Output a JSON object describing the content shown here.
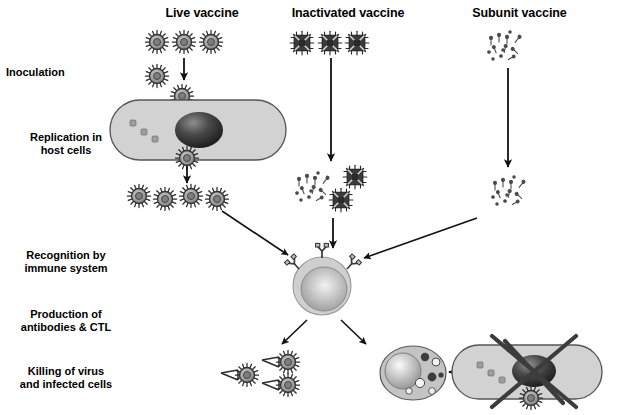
{
  "diagram": {
    "title_row": {
      "columns": [
        {
          "label": "Live vaccine",
          "x": 137,
          "y": 6,
          "w": 130
        },
        {
          "label": "Inactivated vaccine",
          "x": 268,
          "y": 6,
          "w": 160
        },
        {
          "label": "Subunit vaccine",
          "x": 447,
          "y": 6,
          "w": 145
        }
      ]
    },
    "stage_labels": [
      {
        "name": "inoculation",
        "text": "Inoculation",
        "x": 6,
        "y": 66,
        "w": 120,
        "align": "left"
      },
      {
        "name": "replication",
        "text": "Replication in\nhost cells",
        "x": 6,
        "y": 131,
        "w": 120,
        "align": "center"
      },
      {
        "name": "recognition",
        "text": "Recognition by\nimmune system",
        "x": 2,
        "y": 249,
        "w": 128,
        "align": "center"
      },
      {
        "name": "production",
        "text": "Production of\nantibodies & CTL",
        "x": 2,
        "y": 308,
        "w": 128,
        "align": "center"
      },
      {
        "name": "killing",
        "text": "Killing of virus\nand infected cells",
        "x": 2,
        "y": 365,
        "w": 128,
        "align": "center"
      }
    ],
    "icons": {
      "live_virion": "enveloped-virus-with-spikes",
      "inactivated_virion": "inactivated-virus-crossed-square",
      "subunit_fragment": "subunit-protein-fragments",
      "host_cell": "host-cell-with-nucleus",
      "immune_cell": "b-lymphocyte-with-receptors",
      "antibody": "y-shaped-antibody",
      "ctl": "cytotoxic-t-lymphocyte-with-granules",
      "killed_cell": "infected-cell-crossed-out",
      "arrow": "arrow-icon"
    },
    "colors": {
      "ink": "#000000",
      "cell_fill": "#d2d2d2",
      "cell_stroke": "#4a4a4a",
      "nucleus_dark": "#2c2c2c",
      "nucleus_light": "#e8e8e8",
      "virion_fill": "#9a9a9a",
      "virion_stroke": "#3b3b3b",
      "inactivated_fill": "#3a3a3a",
      "background": "#ffffff"
    },
    "rows": {
      "live": {
        "top_virions": [
          {
            "x": 157,
            "y": 42
          },
          {
            "x": 184,
            "y": 42
          },
          {
            "x": 211,
            "y": 42
          }
        ],
        "entering_virions": [
          {
            "x": 157,
            "y": 75
          },
          {
            "x": 181,
            "y": 95
          }
        ],
        "released_virions": [
          {
            "x": 139,
            "y": 193
          },
          {
            "x": 164,
            "y": 196
          },
          {
            "x": 190,
            "y": 193
          },
          {
            "x": 215,
            "y": 196
          }
        ],
        "cell": {
          "cx": 198,
          "cy": 130,
          "rx": 88,
          "ry": 30
        }
      },
      "inactivated": {
        "top_virions": [
          {
            "x": 302,
            "y": 42
          },
          {
            "x": 330,
            "y": 42
          },
          {
            "x": 357,
            "y": 42
          }
        ],
        "mid_cluster": [
          {
            "x": 331,
            "y": 178
          },
          {
            "x": 322,
            "y": 201
          }
        ],
        "mid_fragments_center": {
          "x": 295,
          "y": 185
        }
      },
      "subunit": {
        "top_fragments_center": {
          "x": 500,
          "y": 45
        },
        "mid_fragments_center": {
          "x": 508,
          "y": 190
        }
      },
      "immune": {
        "cell": {
          "cx": 322,
          "cy": 283,
          "r": 28
        },
        "receptors": 3
      },
      "killing": {
        "antibody_virions": [
          {
            "x": 246,
            "y": 373
          },
          {
            "x": 287,
            "y": 360
          },
          {
            "x": 285,
            "y": 382
          }
        ],
        "ctl": {
          "cx": 413,
          "cy": 373
        },
        "infected_cell": {
          "cx": 524,
          "cy": 372,
          "rx": 74,
          "ry": 27
        },
        "budding_virion": {
          "x": 530,
          "y": 397
        }
      }
    }
  }
}
